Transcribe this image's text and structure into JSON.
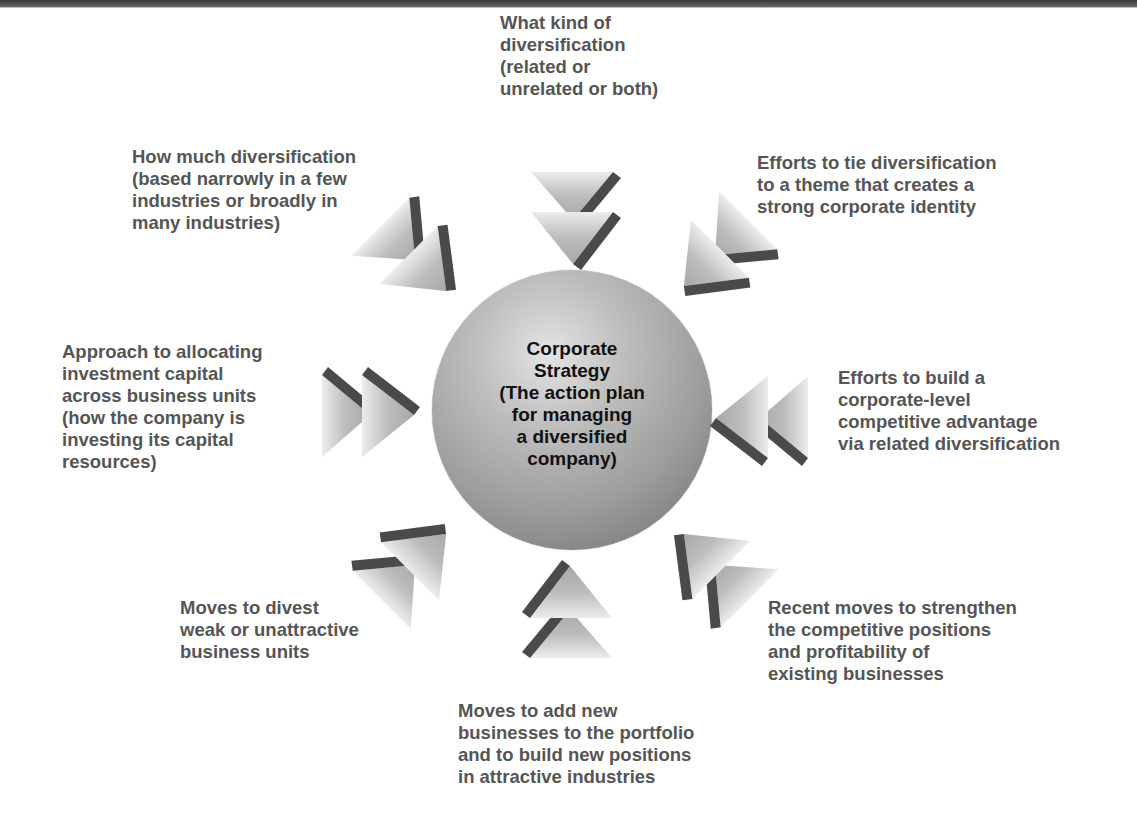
{
  "diagram": {
    "center": {
      "title": "Corporate\nStrategy\n(The action plan\nfor managing\na diversified\ncompany)"
    },
    "nodes": [
      {
        "id": "top",
        "text": "What kind of\ndiversification\n(related or\nunrelated or both)",
        "arrow_direction": "down"
      },
      {
        "id": "top-right",
        "text": "Efforts to tie diversification\nto a theme that creates a\nstrong corporate identity",
        "arrow_direction": "down-left"
      },
      {
        "id": "right",
        "text": "Efforts to build a\ncorporate-level\ncompetitive advantage\nvia related diversification",
        "arrow_direction": "left"
      },
      {
        "id": "bottom-right",
        "text": "Recent moves to strengthen\nthe competitive positions\nand profitability of\nexisting businesses",
        "arrow_direction": "up-left"
      },
      {
        "id": "bottom",
        "text": "Moves to add new\nbusinesses to the portfolio\nand to build new positions\nin attractive industries",
        "arrow_direction": "up"
      },
      {
        "id": "bottom-left",
        "text": "Moves to divest\nweak or unattractive\nbusiness units",
        "arrow_direction": "up-right"
      },
      {
        "id": "left",
        "text": "Approach to allocating\ninvestment capital\nacross business units\n(how the company is\ninvesting its capital\nresources)",
        "arrow_direction": "right"
      },
      {
        "id": "top-left",
        "text": "How much diversification\n(based narrowly in a few\nindustries or broadly in\nmany industries)",
        "arrow_direction": "down-right"
      }
    ],
    "icons": {
      "arrow": "double-chevron-arrow-icon",
      "center": "sphere"
    },
    "colors": {
      "label_text": "#555555",
      "center_text": "#111111",
      "arrow_face": "#b8b8b8",
      "arrow_side": "#4a4a4a",
      "top_bar": "#4a4a4a"
    }
  }
}
